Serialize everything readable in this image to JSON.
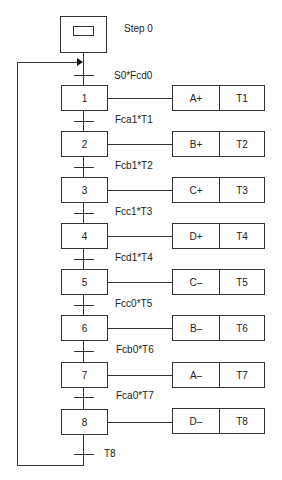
{
  "diagram": {
    "type": "GRAFCET sequential function chart",
    "initial_step": {
      "label": "Step 0"
    },
    "steps": [
      {
        "number": "1",
        "action": "A+",
        "timer": "T1",
        "transition_in": "S0*Fcd0"
      },
      {
        "number": "2",
        "action": "B+",
        "timer": "T2",
        "transition_in": "Fca1*T1"
      },
      {
        "number": "3",
        "action": "C+",
        "timer": "T3",
        "transition_in": "Fcb1*T2"
      },
      {
        "number": "4",
        "action": "D+",
        "timer": "T4",
        "transition_in": "Fcc1*T3"
      },
      {
        "number": "5",
        "action": "C–",
        "timer": "T5",
        "transition_in": "Fcd1*T4"
      },
      {
        "number": "6",
        "action": "B–",
        "timer": "T6",
        "transition_in": "Fcc0*T5"
      },
      {
        "number": "7",
        "action": "A–",
        "timer": "T7",
        "transition_in": "Fcb0*T6"
      },
      {
        "number": "8",
        "action": "D–",
        "timer": "T8",
        "transition_in": "Fca0*T7"
      }
    ],
    "final_transition": "T8",
    "colors": {
      "line": "#333333",
      "background": "#ffffff",
      "text": "#222222"
    }
  }
}
